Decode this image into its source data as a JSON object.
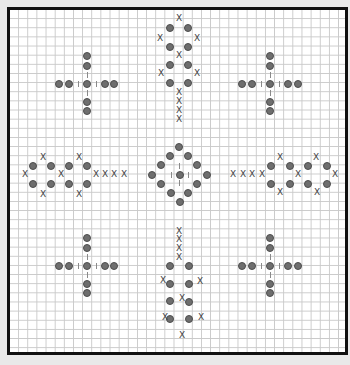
{
  "chart": {
    "title": "",
    "grid": {
      "cell_px": 9.15,
      "line_color": "#c9c9c9",
      "border_color": "#111111",
      "background": "#ffffff"
    },
    "legend": {
      "bead_symbol": "filled-circle",
      "stitch_symbol": "X",
      "connector_symbol": "|"
    },
    "colors": {
      "bead": "#6e6e6e",
      "x_mark": "#444444",
      "page_bg": "#e9e9e9"
    }
  },
  "motifs": [
    {
      "name": "cross-top-left",
      "beads": [
        [
          87,
          56
        ],
        [
          87,
          66
        ],
        [
          59,
          84
        ],
        [
          69,
          84
        ],
        [
          87,
          84
        ],
        [
          105,
          84
        ],
        [
          114,
          84
        ],
        [
          87,
          102
        ],
        [
          87,
          111
        ]
      ],
      "xs": [],
      "bars": [
        [
          87,
          75
        ],
        [
          87,
          93
        ],
        [
          78,
          84
        ],
        [
          96,
          84
        ]
      ]
    },
    {
      "name": "leaf-top-center",
      "beads": [
        [
          170,
          28
        ],
        [
          188,
          28
        ],
        [
          170,
          47
        ],
        [
          188,
          47
        ],
        [
          170,
          65
        ],
        [
          188,
          65
        ],
        [
          170,
          83
        ],
        [
          188,
          83
        ]
      ],
      "xs": [
        [
          179,
          18
        ],
        [
          160,
          38
        ],
        [
          197,
          38
        ],
        [
          179,
          55
        ],
        [
          161,
          73
        ],
        [
          197,
          73
        ],
        [
          179,
          92
        ],
        [
          179,
          101
        ],
        [
          179,
          110
        ],
        [
          179,
          119
        ]
      ],
      "bars": []
    },
    {
      "name": "cross-top-right",
      "beads": [
        [
          270,
          56
        ],
        [
          270,
          66
        ],
        [
          242,
          84
        ],
        [
          252,
          84
        ],
        [
          270,
          84
        ],
        [
          288,
          84
        ],
        [
          298,
          84
        ],
        [
          270,
          102
        ],
        [
          270,
          111
        ]
      ],
      "xs": [],
      "bars": [
        [
          270,
          75
        ],
        [
          270,
          93
        ],
        [
          261,
          84
        ],
        [
          279,
          84
        ]
      ]
    },
    {
      "name": "leaf-middle-left",
      "beads": [
        [
          33,
          166
        ],
        [
          51,
          166
        ],
        [
          69,
          166
        ],
        [
          87,
          166
        ],
        [
          33,
          184
        ],
        [
          51,
          184
        ],
        [
          69,
          184
        ],
        [
          87,
          184
        ]
      ],
      "xs": [
        [
          43,
          157
        ],
        [
          79,
          157
        ],
        [
          25,
          174
        ],
        [
          61,
          174
        ],
        [
          96,
          174
        ],
        [
          105,
          174
        ],
        [
          114,
          174
        ],
        [
          124,
          174
        ],
        [
          43,
          194
        ],
        [
          79,
          194
        ]
      ],
      "bars": []
    },
    {
      "name": "diamond-center",
      "beads": [
        [
          179,
          147
        ],
        [
          170,
          156
        ],
        [
          188,
          156
        ],
        [
          161,
          165
        ],
        [
          197,
          165
        ],
        [
          152,
          175
        ],
        [
          180,
          175
        ],
        [
          207,
          175
        ],
        [
          161,
          184
        ],
        [
          197,
          184
        ],
        [
          171,
          193
        ],
        [
          188,
          193
        ],
        [
          180,
          202
        ]
      ],
      "xs": [],
      "bars": [
        [
          179,
          166
        ],
        [
          179,
          183
        ],
        [
          171,
          175
        ],
        [
          188,
          175
        ]
      ]
    },
    {
      "name": "leaf-middle-right",
      "beads": [
        [
          271,
          166
        ],
        [
          290,
          166
        ],
        [
          308,
          166
        ],
        [
          327,
          166
        ],
        [
          271,
          184
        ],
        [
          290,
          184
        ],
        [
          308,
          184
        ],
        [
          327,
          184
        ]
      ],
      "xs": [
        [
          233,
          174
        ],
        [
          243,
          174
        ],
        [
          252,
          174
        ],
        [
          262,
          174
        ],
        [
          280,
          157
        ],
        [
          316,
          157
        ],
        [
          298,
          174
        ],
        [
          335,
          174
        ],
        [
          280,
          192
        ],
        [
          317,
          192
        ]
      ],
      "bars": []
    },
    {
      "name": "cross-bottom-left",
      "beads": [
        [
          87,
          238
        ],
        [
          87,
          248
        ],
        [
          59,
          266
        ],
        [
          69,
          266
        ],
        [
          87,
          266
        ],
        [
          105,
          266
        ],
        [
          114,
          266
        ],
        [
          87,
          284
        ],
        [
          87,
          293
        ]
      ],
      "xs": [],
      "bars": [
        [
          87,
          257
        ],
        [
          87,
          275
        ],
        [
          78,
          266
        ],
        [
          96,
          266
        ]
      ]
    },
    {
      "name": "leaf-bottom-center",
      "beads": [
        [
          170,
          266
        ],
        [
          189,
          266
        ],
        [
          170,
          284
        ],
        [
          189,
          284
        ],
        [
          170,
          301
        ],
        [
          189,
          302
        ],
        [
          170,
          319
        ],
        [
          189,
          319
        ]
      ],
      "xs": [
        [
          179,
          231
        ],
        [
          179,
          239
        ],
        [
          179,
          248
        ],
        [
          179,
          257
        ],
        [
          163,
          280
        ],
        [
          200,
          281
        ],
        [
          182,
          298
        ],
        [
          165,
          317
        ],
        [
          201,
          317
        ],
        [
          182,
          335
        ]
      ],
      "bars": []
    },
    {
      "name": "cross-bottom-right",
      "beads": [
        [
          270,
          238
        ],
        [
          270,
          248
        ],
        [
          242,
          266
        ],
        [
          252,
          266
        ],
        [
          270,
          266
        ],
        [
          288,
          266
        ],
        [
          298,
          266
        ],
        [
          270,
          284
        ],
        [
          270,
          293
        ]
      ],
      "xs": [],
      "bars": [
        [
          270,
          257
        ],
        [
          270,
          275
        ],
        [
          261,
          266
        ],
        [
          279,
          266
        ]
      ]
    }
  ]
}
